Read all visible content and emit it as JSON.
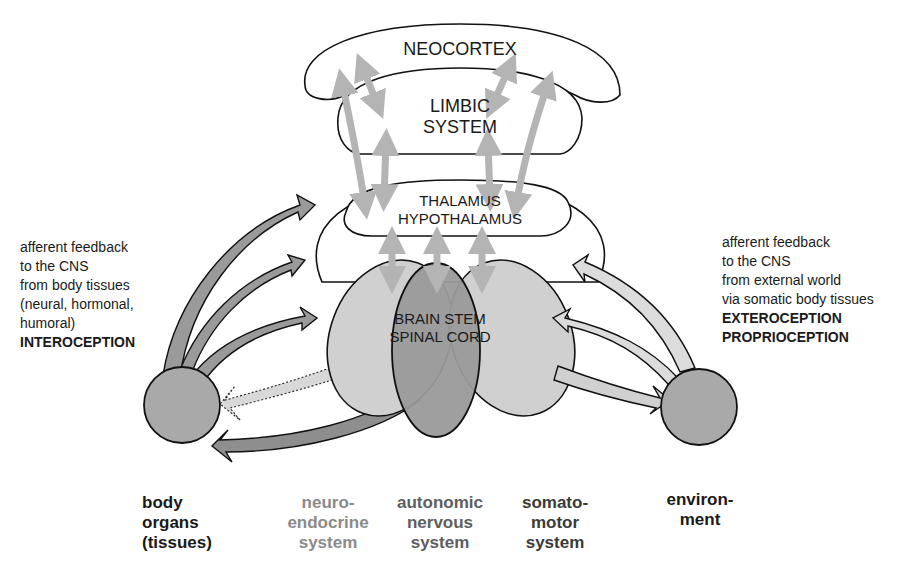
{
  "diagram": {
    "regions": {
      "neocortex": "NEOCORTEX",
      "limbic": [
        "LIMBIC",
        "SYSTEM"
      ],
      "thalamus": [
        "THALAMUS",
        "HYPOTHALAMUS"
      ],
      "brainstem": [
        "BRAIN STEM",
        "SPINAL CORD"
      ]
    },
    "left_annotation": {
      "lines": [
        "afferent feedback",
        "to the CNS",
        "from body tissues",
        "(neural, hormonal,",
        "humoral)"
      ],
      "emphasis": "INTEROCEPTION"
    },
    "right_annotation": {
      "lines": [
        "afferent feedback",
        "to the CNS",
        "from external world",
        "via somatic body tissues"
      ],
      "emphasis": [
        "EXTEROCEPTION",
        "PROPRIOCEPTION"
      ]
    },
    "bottom_labels": {
      "body_organs": [
        "body",
        "organs",
        "(tissues)"
      ],
      "neuroendocrine": [
        "neuro-",
        "endocrine",
        "system"
      ],
      "autonomic": [
        "autonomic",
        "nervous",
        "system"
      ],
      "somatomotor": [
        "somato-",
        "motor",
        "system"
      ],
      "environment": [
        "environ-",
        "ment"
      ]
    },
    "colors": {
      "outline": "#111111",
      "light_fill": "#d2d2d2",
      "mid_fill": "#a8a8a8",
      "dark_fill": "#8e8e8e",
      "circle_fill": "#a9a9a9",
      "grey_arrow": "#b4b4b4",
      "neuroendocrine_text": "#8a8a8a",
      "autonomic_text": "#5e5e5e",
      "somatomotor_text": "#3a3a3a",
      "dark_text": "#1a1a1a"
    }
  }
}
